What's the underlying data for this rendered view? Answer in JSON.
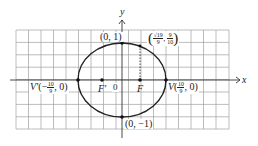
{
  "figure": {
    "type": "ellipse-plot",
    "axes": {
      "x_label": "x",
      "y_label": "y",
      "origin_label": "0"
    },
    "grid": {
      "columns": 17,
      "rows": 8,
      "color": "#9a9a9a"
    },
    "curve_color": "#222222",
    "points": {
      "top": {
        "label": "(0, 1)"
      },
      "bottom": {
        "label": "(0, −1)"
      },
      "vertex_right": {
        "name": "V",
        "coord_prefix": "(",
        "num": "10",
        "den": "9",
        "coord_suffix": ", 0)"
      },
      "vertex_left": {
        "name": "V′",
        "coord_prefix": "(−",
        "num": "10",
        "den": "9",
        "coord_suffix": ", 0)"
      },
      "focus_right": {
        "label": "F"
      },
      "focus_left": {
        "label": "F′"
      },
      "latus_point": {
        "x_num": "√19",
        "x_den": "9",
        "y_num": "9",
        "y_den": "10"
      }
    }
  }
}
